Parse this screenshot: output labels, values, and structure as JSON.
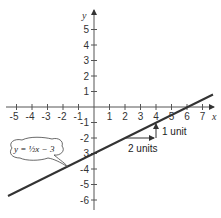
{
  "diagram": {
    "type": "coordinate-graph",
    "axes": {
      "x_label": "x",
      "y_label": "y",
      "x_ticks": [
        "-5",
        "-4",
        "-3",
        "-2",
        "-1",
        "1",
        "2",
        "3",
        "4",
        "5",
        "6",
        "7"
      ],
      "y_ticks": [
        "5",
        "4",
        "3",
        "2",
        "1",
        "-1",
        "-2",
        "-3",
        "-4",
        "-5",
        "-6"
      ],
      "x_range": [
        -5.5,
        7.5
      ],
      "y_range": [
        -6.5,
        6
      ]
    },
    "line": {
      "equation_label": "y = ½x − 3",
      "slope": 0.5,
      "y_intercept": -3,
      "x_intercept": 6,
      "color": "#333333"
    },
    "slope_triangle": {
      "run_label": "2 units",
      "rise_label": "1 unit",
      "start": [
        2,
        -2
      ],
      "corner": [
        4,
        -2
      ],
      "end": [
        4,
        -1
      ]
    }
  }
}
